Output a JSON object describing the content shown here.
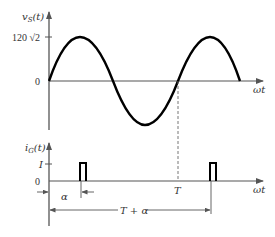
{
  "top_plot": {
    "y_label": "v_S(t)",
    "y_label_main": "v",
    "y_label_sub": "S",
    "y_label_arg": "(t)",
    "peak_label": "120 √2",
    "zero_label": "0",
    "x_label": "ωt"
  },
  "bottom_plot": {
    "y_label_main": "i",
    "y_label_sub": "G",
    "y_label_arg": "(t)",
    "pulse_level_label": "I",
    "zero_label": "0",
    "x_label": "ωt",
    "period_marker_label": "T",
    "alpha_label": "α",
    "span_label": "T + α"
  },
  "colors": {
    "curve": "#000000",
    "axis": "#555555",
    "text": "#333333"
  }
}
